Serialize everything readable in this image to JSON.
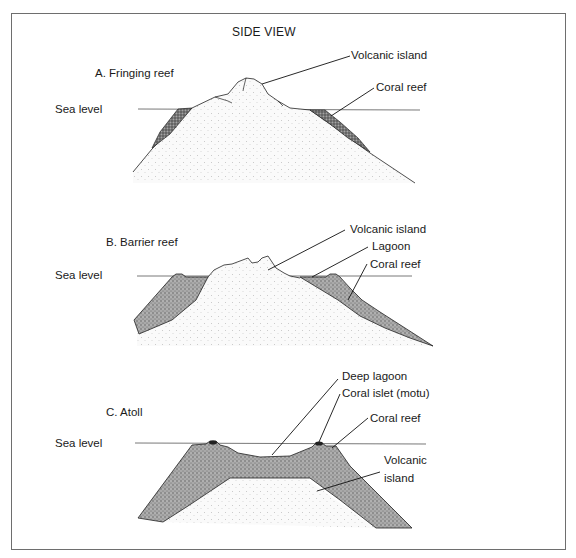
{
  "figure": {
    "title": "SIDE VIEW",
    "panels": [
      {
        "id": "A",
        "heading": "A.  Fringing reef",
        "sea_level_label": "Sea level",
        "labels": [
          "Volcanic island",
          "Coral reef"
        ]
      },
      {
        "id": "B",
        "heading": "B.  Barrier reef",
        "sea_level_label": "Sea level",
        "labels": [
          "Volcanic island",
          "Lagoon",
          "Coral reef"
        ]
      },
      {
        "id": "C",
        "heading": "C.  Atoll",
        "sea_level_label": "Sea level",
        "labels": [
          "Deep lagoon",
          "Coral islet (motu)",
          "Coral reef",
          "Volcanic",
          "island"
        ]
      }
    ]
  },
  "colors": {
    "frame": "#6e6e6e",
    "line": "#222222",
    "sea_line": "#555555",
    "island_fill": "#f4f4f4",
    "reef_fill": "#8a8a8a"
  }
}
